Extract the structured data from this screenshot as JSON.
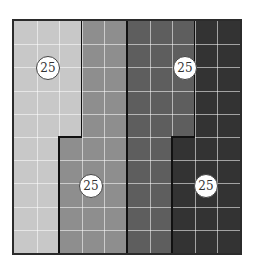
{
  "diagram": {
    "grid": {
      "columns": 10,
      "rows": 10
    },
    "regions": [
      {
        "name": "region-1",
        "shade": "#c8c8c8",
        "cells": 25,
        "label": "25",
        "top_cols": [
          0,
          3
        ],
        "bottom_cols": [
          0,
          2
        ]
      },
      {
        "name": "region-2",
        "shade": "#8e8e8e",
        "cells": 25,
        "label": "25",
        "top_cols": [
          3,
          5
        ],
        "bottom_cols": [
          2,
          5
        ]
      },
      {
        "name": "region-3",
        "shade": "#5e5e5e",
        "cells": 25,
        "label": "25",
        "top_cols": [
          5,
          8
        ],
        "bottom_cols": [
          5,
          7
        ]
      },
      {
        "name": "region-4",
        "shade": "#333333",
        "cells": 25,
        "label": "25",
        "top_cols": [
          8,
          10
        ],
        "bottom_cols": [
          7,
          10
        ]
      }
    ],
    "labels": [
      {
        "text": "25",
        "x": 48,
        "y": 68
      },
      {
        "text": "25",
        "x": 185,
        "y": 68
      },
      {
        "text": "25",
        "x": 91,
        "y": 186
      },
      {
        "text": "25",
        "x": 206,
        "y": 186
      }
    ]
  }
}
